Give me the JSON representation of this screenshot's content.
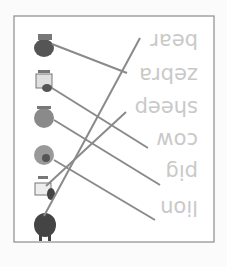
{
  "worksheet": {
    "orientation": "rotated 180 degrees",
    "words": [
      "bear",
      "zebra",
      "sheep",
      "cow",
      "pig",
      "lion"
    ],
    "animals": [
      "bear-illustration",
      "zebra-illustration",
      "sheep-illustration",
      "cow-illustration",
      "pig-illustration",
      "lion-illustration"
    ],
    "colors": {
      "frame": "#8c8c8c",
      "line": "#8a8a8a",
      "word": "#c9c9c9",
      "animal": "#555555"
    }
  }
}
